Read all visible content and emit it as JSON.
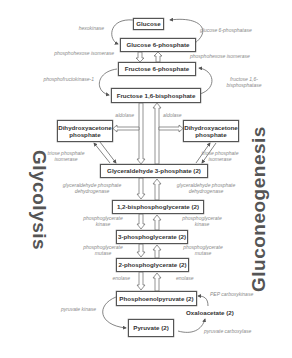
{
  "title_left": "Glycolysis",
  "title_right": "Gluconeogenesis",
  "metabolites": {
    "glucose": "Glucose",
    "g6p": "Glucose 6-phosphate",
    "f6p": "Fructose 6-phosphate",
    "f16bp": "Fructose 1,6-bisphosphate",
    "dhap_left": "Dihydroxyacetone phosphate",
    "dhap_right": "Dihydroxyacetone phosphate",
    "g3p": "Glyceraldehyde 3-phosphate (2)",
    "bpg": "1,2-bisphosphoglycerate (2)",
    "pg3": "3-phosphoglycerate (2)",
    "pg2": "2-phosphoglycerate (2)",
    "pep": "Phosphoenolpyruvate (2)",
    "oaa": "Oxaloacetate (2)",
    "pyruvate": "Pyruvate (2)"
  },
  "enzymes_glycolysis": {
    "hexokinase": "hexokinase",
    "pgi": "phosphohexose isomerase",
    "pfk": "phosphofructokinase-1",
    "aldolase": "aldolase",
    "tpi": "triose phosphate isomerase",
    "gapdh": "glyceraldehyde phosphate dehydrogenase",
    "pgk": "phosphoglycerate kinase",
    "pgm": "phosphoglycerate mutase",
    "enolase": "enolase",
    "pk": "pyruvate kinase"
  },
  "enzymes_gluconeogenesis": {
    "g6pase": "glucose 6-phosphatase",
    "pgi": "phosphohexose isomerase",
    "fbpase": "fructose 1,6-bisphosphatase",
    "aldolase": "aldolase",
    "tpi": "triose phosphate isomerase",
    "gapdh": "glyceraldehyde phosphate dehydrogenase",
    "pgk": "phosphoglycerate kinase",
    "pgm": "phosphoglycerate mutase",
    "enolase": "enolase",
    "pepck": "PEP carboxykinase",
    "pc": "pyruvate carboxylase"
  }
}
